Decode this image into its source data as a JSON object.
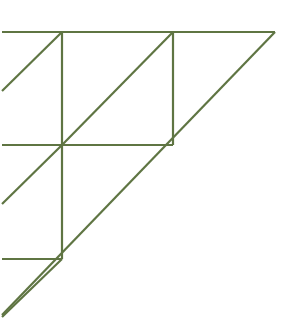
{
  "figure": {
    "background_color": "#ffffff",
    "stroke_color": "#5f7543",
    "stroke_color_light": "#7d8f63",
    "stroke_width": 2.2,
    "canvas": {
      "width": 291,
      "height": 329
    }
  },
  "chart_data": {
    "type": "diagram",
    "xlabel": "",
    "ylabel": "",
    "xlim": [
      0,
      291
    ],
    "ylim": [
      0,
      329
    ],
    "grid": false,
    "legend": "none",
    "units": "pixels",
    "coordinate_origin": "top-left",
    "segments": [
      {
        "name": "top-edge-outer",
        "kind": "horizontal",
        "x1": 2,
        "y1": 32,
        "x2": 275,
        "y2": 32,
        "color": "#5f7543",
        "width": 2.2
      },
      {
        "name": "main-hypotenuse",
        "kind": "diagonal",
        "x1": 275,
        "y1": 32,
        "x2": 2,
        "y2": 315,
        "color": "#5f7543",
        "width": 2.2
      },
      {
        "name": "vertical-left-upper",
        "kind": "vertical",
        "x1": 62,
        "y1": 32,
        "x2": 62,
        "y2": 145,
        "color": "#5f7543",
        "width": 2.2
      },
      {
        "name": "vertical-left-lower",
        "kind": "vertical",
        "x1": 62,
        "y1": 145,
        "x2": 62,
        "y2": 259,
        "color": "#5f7543",
        "width": 2.2
      },
      {
        "name": "vertical-right",
        "kind": "vertical",
        "x1": 173,
        "y1": 32,
        "x2": 173,
        "y2": 145,
        "color": "#5f7543",
        "width": 2.2
      },
      {
        "name": "horizontal-mid",
        "kind": "horizontal",
        "x1": 2,
        "y1": 145,
        "x2": 173,
        "y2": 145,
        "color": "#5f7543",
        "width": 2.2
      },
      {
        "name": "horizontal-lower",
        "kind": "horizontal",
        "x1": 2,
        "y1": 259,
        "x2": 62,
        "y2": 259,
        "color": "#5f7543",
        "width": 2.2
      },
      {
        "name": "diagonal-level1-large",
        "kind": "diagonal",
        "x1": 173,
        "y1": 32,
        "x2": 62,
        "y2": 145,
        "color": "#5f7543",
        "width": 2.2
      },
      {
        "name": "diagonal-level2-upper",
        "kind": "diagonal",
        "x1": 62,
        "y1": 32,
        "x2": 2,
        "y2": 91,
        "color": "#5f7543",
        "width": 2.2
      },
      {
        "name": "diagonal-level2-mid",
        "kind": "diagonal",
        "x1": 62,
        "y1": 145,
        "x2": 2,
        "y2": 204,
        "color": "#5f7543",
        "width": 2.2
      },
      {
        "name": "diagonal-level2-lower",
        "kind": "diagonal",
        "x1": 62,
        "y1": 259,
        "x2": 2,
        "y2": 317,
        "color": "#5f7543",
        "width": 2.2
      }
    ],
    "vertices": [
      {
        "name": "apex-top-right",
        "x": 275,
        "y": 32
      },
      {
        "name": "corner-top-left",
        "x": 2,
        "y": 32
      },
      {
        "name": "node-top-v1",
        "x": 62,
        "y": 32
      },
      {
        "name": "node-top-v2",
        "x": 173,
        "y": 32
      },
      {
        "name": "node-mid-left",
        "x": 2,
        "y": 145
      },
      {
        "name": "node-mid-center",
        "x": 62,
        "y": 145
      },
      {
        "name": "node-mid-right",
        "x": 173,
        "y": 145
      },
      {
        "name": "node-low-left",
        "x": 2,
        "y": 259
      },
      {
        "name": "node-low-center",
        "x": 62,
        "y": 259
      },
      {
        "name": "tail-bottom-left",
        "x": 2,
        "y": 315
      },
      {
        "name": "edge-clip-upper",
        "x": 2,
        "y": 91
      },
      {
        "name": "edge-clip-mid",
        "x": 2,
        "y": 204
      }
    ],
    "counts": {
      "segments": 11,
      "horizontal_segments": 3,
      "vertical_segments": 3,
      "diagonal_segments": 5,
      "recursion_levels": 3
    }
  }
}
